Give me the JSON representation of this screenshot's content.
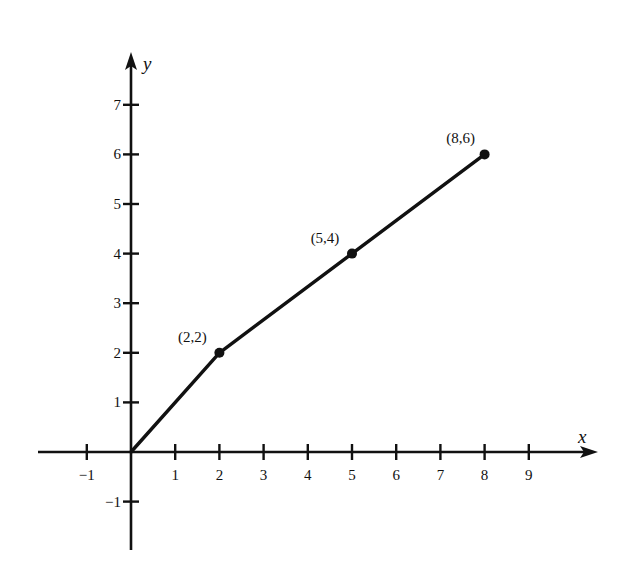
{
  "chart_data": {
    "type": "line",
    "title": "",
    "xlabel": "x",
    "ylabel": "y",
    "xlim": [
      -2,
      10.3
    ],
    "ylim": [
      -2,
      8
    ],
    "grid": false,
    "x_ticks": [
      -1,
      1,
      2,
      3,
      4,
      5,
      6,
      7,
      8,
      9
    ],
    "x_tick_labels": [
      "−1",
      "1",
      "2",
      "3",
      "4",
      "5",
      "6",
      "7",
      "8",
      "9"
    ],
    "y_ticks": [
      -1,
      1,
      2,
      3,
      4,
      5,
      6,
      7
    ],
    "y_tick_labels": [
      "−1",
      "1",
      "2",
      "3",
      "4",
      "5",
      "6",
      "7"
    ],
    "series": [
      {
        "name": "piecewise",
        "x": [
          0,
          2,
          5,
          8
        ],
        "y": [
          0,
          2,
          4,
          6
        ],
        "markers": [
          false,
          true,
          true,
          true
        ]
      }
    ],
    "annotations": [
      {
        "text": "(2,2)",
        "x": 2,
        "y": 2
      },
      {
        "text": "(5,4)",
        "x": 5,
        "y": 4
      },
      {
        "text": "(8,6)",
        "x": 8,
        "y": 6
      }
    ],
    "colors": {
      "ink": "#111111",
      "background": "#ffffff"
    }
  }
}
